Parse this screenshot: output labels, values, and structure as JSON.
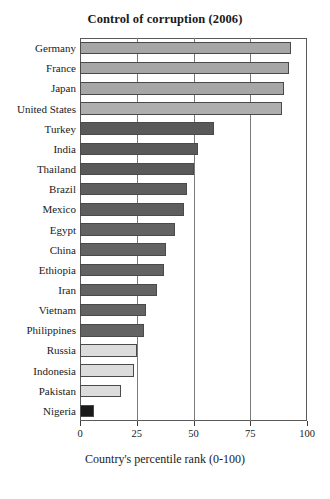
{
  "chart_data": {
    "type": "bar",
    "orientation": "horizontal",
    "title": "Control of corruption (2006)",
    "xlabel": "Country's percentile rank (0-100)",
    "ylabel": "",
    "xlim": [
      0,
      100
    ],
    "xticks": [
      0,
      25,
      50,
      75,
      100
    ],
    "xtick_labels": [
      "0",
      "25",
      "50",
      "75",
      "100"
    ],
    "grid": "vertical",
    "legend": "none",
    "categories": [
      "Germany",
      "France",
      "Japan",
      "United States",
      "Turkey",
      "India",
      "Thailand",
      "Brazil",
      "Mexico",
      "Egypt",
      "China",
      "Ethiopia",
      "Iran",
      "Vietnam",
      "Philippines",
      "Russia",
      "Indonesia",
      "Pakistan",
      "Nigeria"
    ],
    "values": [
      93,
      92,
      90,
      89,
      59,
      52,
      50,
      47,
      46,
      42,
      38,
      37,
      34,
      29,
      28,
      25,
      24,
      18,
      6
    ],
    "bar_colors": [
      "#a6a6a6",
      "#a6a6a6",
      "#a6a6a6",
      "#aeaeae",
      "#595959",
      "#595959",
      "#595959",
      "#5e5e5e",
      "#5e5e5e",
      "#636363",
      "#636363",
      "#636363",
      "#636363",
      "#636363",
      "#636363",
      "#dcdcdc",
      "#dcdcdc",
      "#dcdcdc",
      "#1a1a1a"
    ]
  },
  "colors": {
    "frame": "#5a5a5a",
    "gridline": "#7a7a7a",
    "bar_outline": "#4a4a4a",
    "background": "#ffffff",
    "text": "#1a1a1a"
  }
}
